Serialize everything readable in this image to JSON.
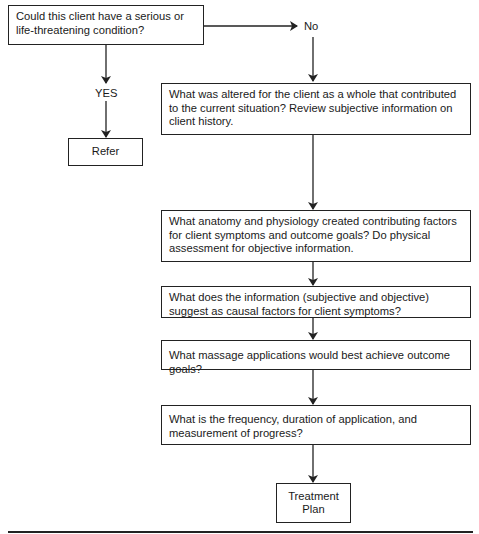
{
  "diagram": {
    "type": "flowchart",
    "start": {
      "text": "Could this client have a serious or life-threatening condition?"
    },
    "branches": {
      "yes_label": "YES",
      "no_label": "No"
    },
    "yes_outcome": {
      "text": "Refer"
    },
    "no_steps": [
      {
        "text": "What was altered for the client as a whole that contributed to the current situation? Review subjective information on client history."
      },
      {
        "text": "What anatomy and physiology created contributing factors for client symptoms and outcome goals? Do physical assessment for objective information."
      },
      {
        "text": "What does the information (subjective and objective) suggest as causal factors for client symptoms?"
      },
      {
        "text": "What massage applications would best achieve outcome goals?"
      },
      {
        "text": "What is the frequency, duration of application, and measurement of progress?"
      }
    ],
    "end": {
      "line1": "Treatment",
      "line2": "Plan"
    },
    "colors": {
      "stroke": "#222222",
      "background": "#ffffff",
      "text": "#1a1a1a"
    }
  }
}
